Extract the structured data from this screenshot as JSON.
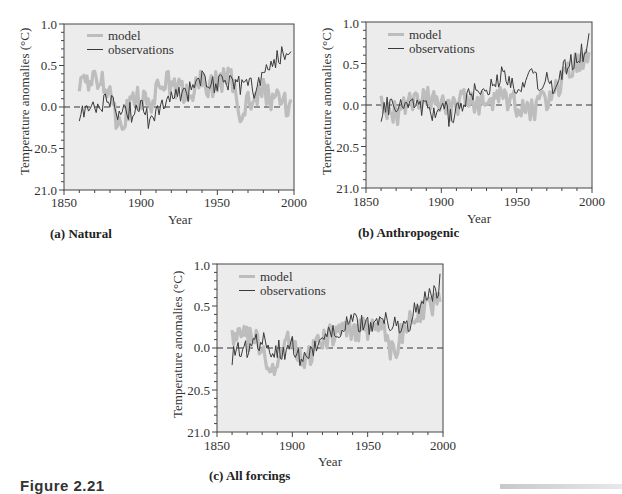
{
  "figure": {
    "caption_partial": "Figure 2.21",
    "legend": {
      "model": "model",
      "observations": "observations"
    },
    "xlabel": "Year",
    "ylabel": "Temperature anomalies (°C)",
    "x_ticks": [
      "1850",
      "1900",
      "1950",
      "2000"
    ],
    "y_ticks": [
      "1.0",
      "0.5",
      "0.0",
      "20.5",
      "21.0"
    ],
    "colors": {
      "model": "#bdbdbd",
      "observations": "#3a3a3a",
      "plot_background": "#ececec"
    }
  },
  "panels": [
    {
      "id": "a",
      "caption": "(a) Natural"
    },
    {
      "id": "b",
      "caption": "(b) Anthropogenic"
    },
    {
      "id": "c",
      "caption": "(c) All forcings"
    }
  ],
  "chart_data": [
    {
      "type": "line",
      "title": "(a) Natural",
      "xlabel": "Year",
      "ylabel": "Temperature anomalies (°C)",
      "xlim": [
        1850,
        2000
      ],
      "ylim": [
        -1.0,
        1.0
      ],
      "y_tick_labels": [
        "1.0",
        "0.5",
        "0.0",
        "20.5",
        "21.0"
      ],
      "x_tick_labels": [
        "1850",
        "1900",
        "1950",
        "2000"
      ],
      "legend_position": "upper left",
      "reference_line": {
        "y": 0.0,
        "style": "dashed"
      },
      "x": [
        1860,
        1865,
        1870,
        1875,
        1880,
        1885,
        1890,
        1895,
        1900,
        1905,
        1910,
        1915,
        1920,
        1925,
        1930,
        1935,
        1940,
        1945,
        1950,
        1955,
        1960,
        1965,
        1970,
        1975,
        1980,
        1985,
        1990,
        1995,
        2000
      ],
      "series": [
        {
          "name": "model",
          "values": [
            0.25,
            0.3,
            0.3,
            0.35,
            0.2,
            -0.2,
            -0.1,
            0.1,
            0.1,
            0.0,
            0.15,
            0.35,
            0.25,
            0.2,
            0.15,
            0.2,
            0.3,
            0.25,
            0.3,
            0.35,
            0.3,
            -0.05,
            0.1,
            0.05,
            0.25,
            0.05,
            0.2,
            0.0,
            0.1
          ]
        },
        {
          "name": "observations",
          "values": [
            -0.1,
            0.0,
            0.0,
            0.05,
            0.1,
            -0.05,
            0.0,
            -0.1,
            0.05,
            -0.15,
            -0.1,
            0.05,
            0.1,
            0.2,
            0.15,
            0.3,
            0.35,
            0.3,
            0.25,
            0.3,
            0.35,
            0.25,
            0.3,
            0.2,
            0.4,
            0.5,
            0.6,
            0.65,
            0.85
          ]
        }
      ]
    },
    {
      "type": "line",
      "title": "(b) Anthropogenic",
      "xlabel": "Year",
      "ylabel": "Temperature anomalies (°C)",
      "xlim": [
        1850,
        2000
      ],
      "ylim": [
        -1.0,
        1.0
      ],
      "y_tick_labels": [
        "1.0",
        "0.5",
        "0.0",
        "20.5",
        "21.0"
      ],
      "x_tick_labels": [
        "1850",
        "1900",
        "1950",
        "2000"
      ],
      "legend_position": "upper left",
      "reference_line": {
        "y": 0.0,
        "style": "dashed"
      },
      "x": [
        1860,
        1865,
        1870,
        1875,
        1880,
        1885,
        1890,
        1895,
        1900,
        1905,
        1910,
        1915,
        1920,
        1925,
        1930,
        1935,
        1940,
        1945,
        1950,
        1955,
        1960,
        1965,
        1970,
        1975,
        1980,
        1985,
        1990,
        1995,
        2000
      ],
      "series": [
        {
          "name": "model",
          "values": [
            0.0,
            -0.05,
            -0.1,
            -0.05,
            0.0,
            0.0,
            0.1,
            0.05,
            0.0,
            -0.05,
            -0.05,
            0.1,
            0.05,
            0.0,
            0.05,
            0.0,
            0.1,
            0.05,
            0.0,
            -0.1,
            -0.05,
            0.0,
            0.05,
            0.15,
            0.3,
            0.4,
            0.5,
            0.6,
            0.75
          ]
        },
        {
          "name": "observations",
          "values": [
            -0.1,
            0.0,
            0.0,
            0.05,
            0.1,
            -0.05,
            0.0,
            -0.1,
            0.05,
            -0.15,
            -0.1,
            0.05,
            0.1,
            0.2,
            0.15,
            0.3,
            0.35,
            0.3,
            0.25,
            0.3,
            0.35,
            0.25,
            0.3,
            0.2,
            0.4,
            0.5,
            0.6,
            0.65,
            0.85
          ]
        }
      ]
    },
    {
      "type": "line",
      "title": "(c) All forcings",
      "xlabel": "Year",
      "ylabel": "Temperature anomalies (°C)",
      "xlim": [
        1850,
        2000
      ],
      "ylim": [
        -1.0,
        1.0
      ],
      "y_tick_labels": [
        "1.0",
        "0.5",
        "0.0",
        "20.5",
        "21.0"
      ],
      "x_tick_labels": [
        "1850",
        "1900",
        "1950",
        "2000"
      ],
      "legend_position": "upper left",
      "reference_line": {
        "y": 0.0,
        "style": "dashed"
      },
      "x": [
        1860,
        1865,
        1870,
        1875,
        1880,
        1885,
        1890,
        1895,
        1900,
        1905,
        1910,
        1915,
        1920,
        1925,
        1930,
        1935,
        1940,
        1945,
        1950,
        1955,
        1960,
        1965,
        1970,
        1975,
        1980,
        1985,
        1990,
        1995,
        2000
      ],
      "series": [
        {
          "name": "model",
          "values": [
            0.1,
            0.15,
            0.1,
            0.1,
            0.0,
            -0.3,
            -0.2,
            0.05,
            0.05,
            -0.1,
            -0.15,
            0.0,
            0.1,
            0.15,
            0.15,
            0.2,
            0.25,
            0.2,
            0.25,
            0.3,
            0.3,
            -0.1,
            0.05,
            0.25,
            0.35,
            0.4,
            0.5,
            0.55,
            0.7
          ]
        },
        {
          "name": "observations",
          "values": [
            -0.1,
            0.0,
            0.0,
            0.05,
            0.1,
            -0.05,
            0.0,
            -0.1,
            0.05,
            -0.15,
            -0.1,
            0.05,
            0.1,
            0.2,
            0.15,
            0.3,
            0.35,
            0.3,
            0.25,
            0.3,
            0.35,
            0.25,
            0.3,
            0.2,
            0.4,
            0.5,
            0.6,
            0.65,
            0.85
          ]
        }
      ]
    }
  ]
}
